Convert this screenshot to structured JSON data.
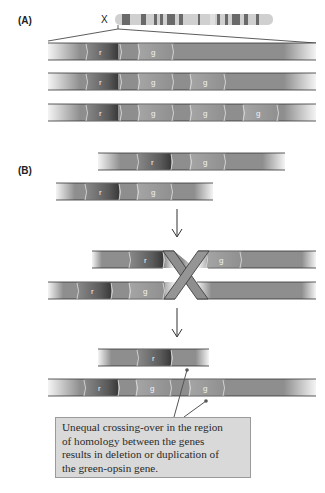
{
  "panels": {
    "a": {
      "label": "(A)"
    },
    "b": {
      "label": "(B)"
    }
  },
  "chromosome": {
    "label": "X"
  },
  "genes": {
    "red": "r",
    "green": "g"
  },
  "panel_a_rows": [
    {
      "genes": [
        "r",
        "g"
      ]
    },
    {
      "genes": [
        "r",
        "g",
        "g"
      ]
    },
    {
      "genes": [
        "r",
        "g",
        "g",
        "g"
      ]
    }
  ],
  "panel_b": {
    "before": [
      {
        "genes": [
          "r",
          "g"
        ]
      },
      {
        "genes": [
          "r",
          "g"
        ]
      }
    ],
    "crossover": [
      {
        "genes": [
          "r",
          "g"
        ]
      },
      {
        "genes": [
          "r",
          "g"
        ]
      }
    ],
    "after": [
      {
        "genes": [
          "r"
        ]
      },
      {
        "genes": [
          "r",
          "g",
          "g"
        ]
      }
    ]
  },
  "callout": {
    "line1": "Unequal crossing-over in the region",
    "line2": "of homology between the genes",
    "line3": "results in deletion or duplication of",
    "line4": "the green-opsin gene."
  },
  "colors": {
    "strand": "#8c8c8c",
    "red_gene": "#5e5e5e",
    "green_gene": "#a8a8a8",
    "outline": "#3a3a3a",
    "callout_bg": "#d9d9d9"
  }
}
